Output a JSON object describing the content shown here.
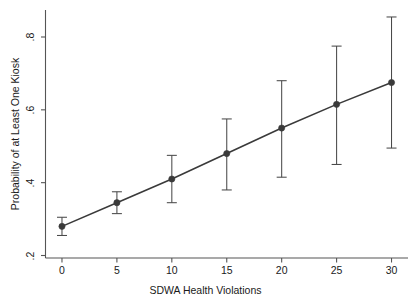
{
  "chart_data": {
    "type": "line",
    "title": "",
    "subtitle": "",
    "xlabel": "SDWA Health Violations",
    "ylabel": "Probability of at Least One Kiosk",
    "x": [
      0,
      5,
      10,
      15,
      20,
      25,
      30
    ],
    "values": [
      0.28,
      0.345,
      0.41,
      0.48,
      0.55,
      0.615,
      0.675
    ],
    "error_low": [
      0.255,
      0.315,
      0.345,
      0.38,
      0.415,
      0.45,
      0.495
    ],
    "error_high": [
      0.305,
      0.375,
      0.475,
      0.575,
      0.68,
      0.775,
      0.855
    ],
    "xlim": [
      -1.5,
      31.5
    ],
    "ylim": [
      0.185,
      0.875
    ],
    "xticks": [
      0,
      5,
      10,
      15,
      20,
      25,
      30
    ],
    "xtick_labels": [
      "0",
      "5",
      "10",
      "15",
      "20",
      "25",
      "30"
    ],
    "yticks": [
      0.2,
      0.4,
      0.6,
      0.8
    ],
    "ytick_labels": [
      ".2",
      ".4",
      ".6",
      ".8"
    ],
    "grid": false,
    "legend": null,
    "legend_position": "none",
    "marker": "filled-circle",
    "series_color": "#3a3a3a",
    "errorbar_color": "#4a4a4a",
    "axis_color": "#555555",
    "background_color": "#ffffff",
    "series": [
      {
        "name": "Predicted probability",
        "values": [
          0.28,
          0.345,
          0.41,
          0.48,
          0.55,
          0.615,
          0.675
        ]
      }
    ]
  }
}
